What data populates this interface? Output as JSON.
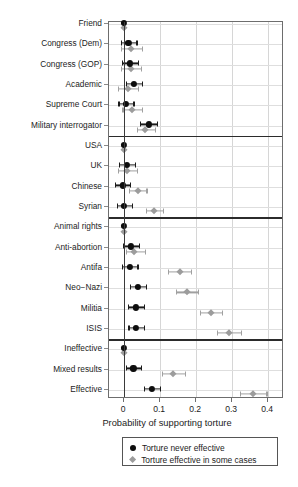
{
  "chart_data": {
    "type": "scatter",
    "title": "",
    "xlabel": "Probability of supporting torture",
    "ylabel": "",
    "xlim": [
      -0.042,
      0.444
    ],
    "xticks": [
      0,
      0.1,
      0.2,
      0.3,
      0.4
    ],
    "xticklabels": [
      "0",
      "0.1",
      "0.2",
      "0.3",
      "0.4"
    ],
    "grid": "vertical-and-horizontal-light",
    "legend_position": "below-axis",
    "orientation": "horizontal-dot-whisker",
    "categories": [
      "Friend",
      "Congress (Dem)",
      "Congress (GOP)",
      "Academic",
      "Supreme Court",
      "Military interrogator",
      "USA",
      "UK",
      "Chinese",
      "Syrian",
      "Animal rights",
      "Anti-abortion",
      "Antifa",
      "Neo−Nazi",
      "Militia",
      "ISIS",
      "Ineffective",
      "Mixed results",
      "Effective"
    ],
    "group_separators_after": [
      "Military interrogator",
      "Syrian",
      "ISIS"
    ],
    "series": [
      {
        "name": "Torture never effective",
        "marker": "circle",
        "color": "#0d0d0d",
        "values": [
          0.0,
          0.012,
          0.016,
          0.028,
          0.004,
          0.068,
          0.0,
          0.008,
          -0.004,
          0.0,
          0.0,
          0.019,
          0.015,
          0.038,
          0.032,
          0.033,
          0.0,
          0.026,
          0.077
        ],
        "ci_low": [
          0.0,
          -0.009,
          -0.006,
          0.006,
          -0.016,
          0.044,
          0.0,
          -0.014,
          -0.025,
          -0.021,
          0.0,
          -0.002,
          -0.007,
          0.016,
          0.01,
          0.012,
          0.0,
          0.006,
          0.054
        ],
        "ci_high": [
          0.0,
          0.034,
          0.038,
          0.05,
          0.026,
          0.092,
          0.0,
          0.03,
          0.017,
          0.021,
          0.0,
          0.04,
          0.037,
          0.06,
          0.055,
          0.055,
          0.0,
          0.046,
          0.1
        ]
      },
      {
        "name": "Torture effective in some cases",
        "marker": "diamond",
        "color": "#9c9c9c",
        "values": [
          0.0,
          0.02,
          0.018,
          0.01,
          0.022,
          0.059,
          0.0,
          0.009,
          0.038,
          0.083,
          0.0,
          0.028,
          0.154,
          0.175,
          0.242,
          0.292,
          0.0,
          0.137,
          0.359
        ],
        "ci_low": [
          0.0,
          -0.009,
          -0.01,
          -0.017,
          -0.005,
          0.035,
          0.0,
          -0.017,
          0.014,
          0.06,
          0.0,
          0.004,
          0.122,
          0.143,
          0.21,
          0.258,
          0.0,
          0.106,
          0.322
        ],
        "ci_high": [
          0.0,
          0.05,
          0.046,
          0.038,
          0.05,
          0.085,
          0.0,
          0.036,
          0.062,
          0.108,
          0.0,
          0.057,
          0.186,
          0.206,
          0.272,
          0.325,
          0.0,
          0.168,
          0.395
        ]
      }
    ]
  },
  "legend": {
    "items": [
      {
        "label": "Torture never effective",
        "marker": "circle"
      },
      {
        "label": "Torture effective in some cases",
        "marker": "diamond"
      }
    ]
  }
}
